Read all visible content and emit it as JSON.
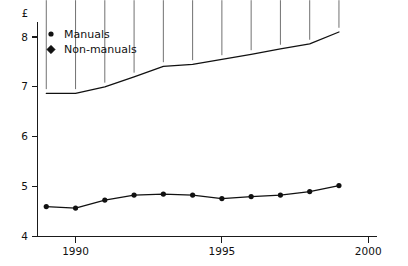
{
  "chart_data": {
    "type": "line",
    "title": "",
    "subtitle": "",
    "xlabel": "",
    "ylabel": "£",
    "x": [
      1989,
      1990,
      1991,
      1992,
      1993,
      1994,
      1995,
      1996,
      1997,
      1998,
      1999
    ],
    "xlim": [
      1988.7,
      2000.3
    ],
    "ylim": [
      4.0,
      8.3
    ],
    "xticks": [
      1990,
      1995,
      2000
    ],
    "xtick_labels": [
      "1990",
      "1995",
      "2000"
    ],
    "yticks": [
      4,
      5,
      6,
      7,
      8
    ],
    "ytick_labels": [
      "4",
      "5",
      "6",
      "7",
      "8"
    ],
    "grid": false,
    "legend_position": "top-left",
    "series": [
      {
        "name": "Manuals",
        "marker": "circle",
        "color": "#111111",
        "values": [
          4.6,
          4.57,
          4.73,
          4.83,
          4.85,
          4.83,
          4.76,
          4.8,
          4.83,
          4.9,
          5.02
        ]
      },
      {
        "name": "Non-manuals",
        "marker": "diamond",
        "color": "#111111",
        "values": [
          6.87,
          6.87,
          7.0,
          7.2,
          7.41,
          7.45,
          7.55,
          7.65,
          7.76,
          7.86,
          8.1
        ]
      }
    ]
  },
  "legend": {
    "entries": [
      {
        "label": "Manuals",
        "marker": "circle"
      },
      {
        "label": "Non-manuals",
        "marker": "diamond"
      }
    ]
  }
}
